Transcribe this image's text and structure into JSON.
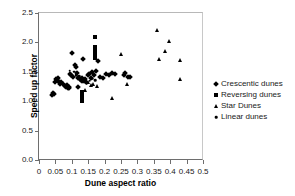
{
  "chart_data": {
    "type": "scatter",
    "title": "",
    "xlabel": "Dune aspect ratio",
    "ylabel": "Speed up factor",
    "xlim": [
      0,
      0.5
    ],
    "ylim": [
      0,
      2.5
    ],
    "xticks": [
      "0",
      "0.05",
      "0.1",
      "0.15",
      "0.2",
      "0.25",
      "0.3",
      "0.35",
      "0.4",
      "0.45",
      "0.5"
    ],
    "xtick_values": [
      0,
      0.05,
      0.1,
      0.15,
      0.2,
      0.25,
      0.3,
      0.35,
      0.4,
      0.45,
      0.5
    ],
    "yticks": [
      "0.0",
      "0.5",
      "1.0",
      "1.5",
      "2.0",
      "2.5"
    ],
    "ytick_values": [
      0.0,
      0.5,
      1.0,
      1.5,
      2.0,
      2.5
    ],
    "grid": false,
    "legend_position": "right",
    "marker_color": "#000000",
    "series": [
      {
        "name": "Crescentic dunes",
        "marker": "diamond",
        "points": [
          [
            0.04,
            1.1
          ],
          [
            0.043,
            1.14
          ],
          [
            0.046,
            1.12
          ],
          [
            0.05,
            1.33
          ],
          [
            0.052,
            1.37
          ],
          [
            0.055,
            1.36
          ],
          [
            0.057,
            1.39
          ],
          [
            0.06,
            1.32
          ],
          [
            0.063,
            1.3
          ],
          [
            0.068,
            1.33
          ],
          [
            0.072,
            1.3
          ],
          [
            0.08,
            1.26
          ],
          [
            0.083,
            1.24
          ],
          [
            0.085,
            1.28
          ],
          [
            0.088,
            1.22
          ],
          [
            0.09,
            1.25
          ],
          [
            0.092,
            1.23
          ],
          [
            0.095,
            1.46
          ],
          [
            0.098,
            1.44
          ],
          [
            0.1,
            1.82
          ],
          [
            0.105,
            1.41
          ],
          [
            0.11,
            1.62
          ],
          [
            0.112,
            1.58
          ],
          [
            0.115,
            1.48
          ],
          [
            0.118,
            1.4
          ],
          [
            0.12,
            1.24
          ],
          [
            0.125,
            1.38
          ],
          [
            0.128,
            1.36
          ],
          [
            0.13,
            1.34
          ],
          [
            0.132,
            1.39
          ],
          [
            0.135,
            1.71
          ],
          [
            0.138,
            1.35
          ],
          [
            0.14,
            1.37
          ],
          [
            0.142,
            1.33
          ],
          [
            0.148,
            1.44
          ],
          [
            0.152,
            1.47
          ],
          [
            0.158,
            1.4
          ],
          [
            0.162,
            1.49
          ],
          [
            0.168,
            1.45
          ],
          [
            0.175,
            1.52
          ],
          [
            0.18,
            1.68
          ],
          [
            0.185,
            1.42
          ],
          [
            0.195,
            1.39
          ],
          [
            0.205,
            1.47
          ],
          [
            0.212,
            1.45
          ],
          [
            0.222,
            1.48
          ],
          [
            0.232,
            1.46
          ],
          [
            0.258,
            1.44
          ],
          [
            0.262,
            1.48
          ],
          [
            0.272,
            1.42
          ],
          [
            0.278,
            1.41
          ]
        ]
      },
      {
        "name": "Reversing dunes",
        "marker": "square",
        "points": [
          [
            0.17,
            2.09
          ],
          [
            0.17,
            1.93
          ],
          [
            0.17,
            1.88
          ],
          [
            0.17,
            1.83
          ],
          [
            0.17,
            1.78
          ],
          [
            0.17,
            1.74
          ],
          [
            0.132,
            1.16
          ],
          [
            0.132,
            1.11
          ],
          [
            0.132,
            1.05
          ],
          [
            0.132,
            1.01
          ]
        ]
      },
      {
        "name": "Star Dunes",
        "marker": "triangle",
        "points": [
          [
            0.25,
            1.8
          ],
          [
            0.36,
            2.21
          ],
          [
            0.365,
            1.72
          ],
          [
            0.385,
            1.85
          ],
          [
            0.395,
            2.03
          ],
          [
            0.43,
            1.7
          ],
          [
            0.43,
            1.38
          ],
          [
            0.222,
            1.06
          ],
          [
            0.268,
            1.29
          ],
          [
            0.16,
            1.27
          ],
          [
            0.165,
            1.3
          ],
          [
            0.178,
            1.26
          ],
          [
            0.148,
            1.33
          ],
          [
            0.14,
            1.19
          ]
        ]
      },
      {
        "name": "Linear dunes",
        "marker": "circle",
        "points": [
          [
            0.093,
            1.52
          ],
          [
            0.108,
            1.5
          ],
          [
            0.113,
            1.44
          ],
          [
            0.122,
            1.43
          ],
          [
            0.145,
            1.3
          ],
          [
            0.155,
            1.35
          ],
          [
            0.163,
            1.38
          ],
          [
            0.172,
            1.36
          ]
        ]
      }
    ]
  },
  "legend": {
    "items": [
      {
        "label": "Crescentic dunes",
        "marker": "diamond"
      },
      {
        "label": "Reversing dunes",
        "marker": "square"
      },
      {
        "label": "Star Dunes",
        "marker": "triangle"
      },
      {
        "label": "Linear dunes",
        "marker": "circle"
      }
    ]
  }
}
